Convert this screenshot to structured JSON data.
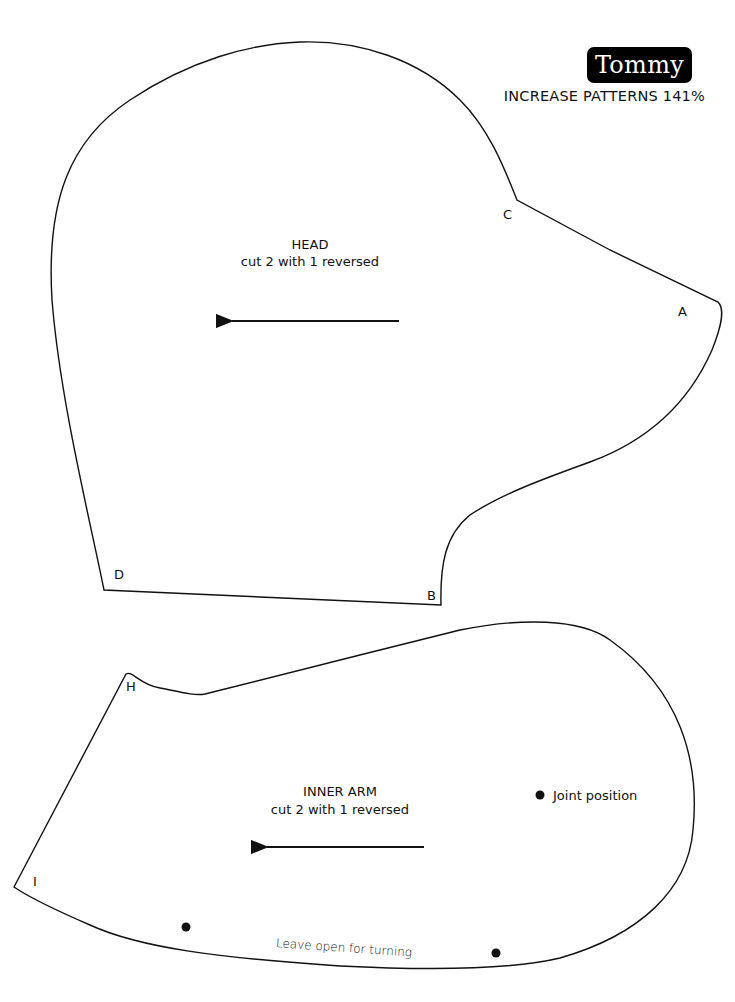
{
  "header": {
    "title": "Tommy",
    "subtitle": "INCREASE PATTERNS 141%"
  },
  "pieces": [
    {
      "name": "HEAD",
      "instruction": "cut 2 with 1 reversed",
      "points": [
        "A",
        "B",
        "C",
        "D"
      ],
      "grainline": "arrow pointing left"
    },
    {
      "name": "INNER ARM",
      "instruction": "cut 2 with 1 reversed",
      "points": [
        "H",
        "I"
      ],
      "grainline": "arrow pointing left",
      "joint_label": "Joint position",
      "opening_label": "Leave open for turning"
    }
  ],
  "colors": {
    "line": "#111111",
    "badge_bg": "#000000",
    "badge_text": "#ffffff",
    "background": "#ffffff"
  }
}
